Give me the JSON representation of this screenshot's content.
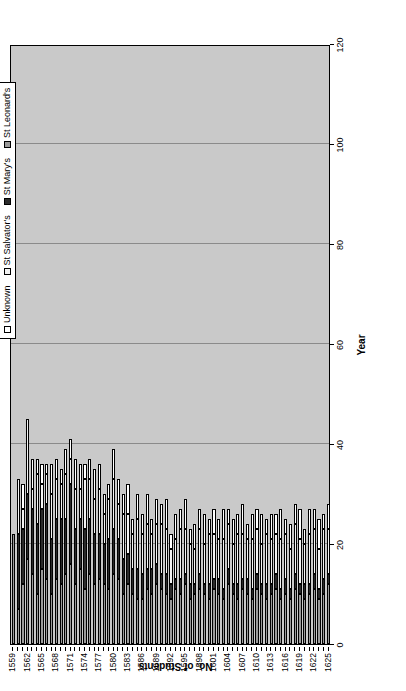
{
  "chart_data": {
    "type": "bar",
    "subtype": "stacked-horizontal-in-rotated-page",
    "title": "",
    "xlabel": "Year",
    "ylabel": "No. of Students",
    "ylim": [
      0,
      120
    ],
    "yticks": [
      0,
      20,
      40,
      60,
      80,
      100,
      120
    ],
    "grid": true,
    "legend_position": "top-right",
    "orientation": "page rotated 90 degrees counter-clockwise",
    "categories": [
      "1559",
      "1560",
      "1561",
      "1562",
      "1563",
      "1564",
      "1565",
      "1566",
      "1567",
      "1568",
      "1569",
      "1570",
      "1571",
      "1572",
      "1573",
      "1574",
      "1575",
      "1576",
      "1577",
      "1578",
      "1579",
      "1580",
      "1581",
      "1582",
      "1583",
      "1584",
      "1585",
      "1586",
      "1587",
      "1588",
      "1589",
      "1590",
      "1591",
      "1592",
      "1593",
      "1594",
      "1595",
      "1596",
      "1597",
      "1598",
      "1599",
      "1600",
      "1601",
      "1602",
      "1603",
      "1604",
      "1605",
      "1606",
      "1607",
      "1608",
      "1609",
      "1610",
      "1611",
      "1612",
      "1613",
      "1614",
      "1615",
      "1616",
      "1617",
      "1618",
      "1619",
      "1620",
      "1621",
      "1622",
      "1623",
      "1624",
      "1625"
    ],
    "tick_labels": [
      "1559",
      "1562",
      "1565",
      "1568",
      "1571",
      "1574",
      "1577",
      "1580",
      "1583",
      "1586",
      "1589",
      "1592",
      "1595",
      "1598",
      "1601",
      "1604",
      "1607",
      "1610",
      "1613",
      "1616",
      "1619",
      "1622",
      "1625"
    ],
    "series": [
      {
        "name": "St Leonard's",
        "color": "#9a9a9a",
        "values": [
          22,
          7,
          12,
          17,
          14,
          10,
          15,
          13,
          10,
          13,
          12,
          14,
          16,
          12,
          15,
          11,
          14,
          12,
          13,
          12,
          11,
          14,
          13,
          10,
          12,
          10,
          9,
          9,
          11,
          10,
          12,
          11,
          10,
          9,
          11,
          10,
          12,
          9,
          10,
          11,
          10,
          9,
          11,
          10,
          9,
          12,
          10,
          9,
          11,
          10,
          9,
          11,
          10,
          9,
          10,
          11,
          9,
          10,
          9,
          11,
          10,
          9,
          10,
          11,
          9,
          10,
          12
        ]
      },
      {
        "name": "St Mary's",
        "color": "#2b2b2b",
        "values": [
          0,
          15,
          11,
          13,
          13,
          14,
          12,
          15,
          11,
          12,
          13,
          11,
          16,
          11,
          10,
          12,
          11,
          10,
          9,
          8,
          10,
          9,
          8,
          7,
          6,
          5,
          6,
          5,
          4,
          5,
          4,
          3,
          4,
          3,
          2,
          3,
          2,
          3,
          2,
          3,
          2,
          3,
          2,
          3,
          2,
          3,
          2,
          3,
          2,
          3,
          2,
          3,
          2,
          3,
          2,
          3,
          2,
          3,
          2,
          3,
          2,
          3,
          2,
          3,
          2,
          3,
          2
        ]
      },
      {
        "name": "St Salvator's",
        "color": "#f2f2f2",
        "values": [
          0,
          11,
          4,
          15,
          4,
          10,
          5,
          6,
          9,
          8,
          7,
          9,
          5,
          8,
          6,
          10,
          8,
          7,
          9,
          6,
          8,
          10,
          7,
          9,
          8,
          7,
          10,
          8,
          9,
          7,
          8,
          10,
          9,
          7,
          8,
          10,
          9,
          8,
          7,
          9,
          8,
          10,
          9,
          8,
          10,
          9,
          8,
          10,
          9,
          8,
          10,
          9,
          8,
          10,
          9,
          8,
          10,
          9,
          8,
          10,
          9,
          8,
          10,
          9,
          8,
          10,
          9
        ]
      },
      {
        "name": "Unknown",
        "color": "#ffffff",
        "values": [
          0,
          0,
          5,
          0,
          6,
          3,
          4,
          2,
          6,
          4,
          3,
          5,
          4,
          6,
          5,
          3,
          4,
          6,
          5,
          4,
          3,
          6,
          5,
          4,
          6,
          3,
          5,
          4,
          6,
          3,
          5,
          4,
          6,
          3,
          5,
          4,
          6,
          3,
          5,
          4,
          6,
          3,
          5,
          4,
          6,
          3,
          5,
          4,
          6,
          3,
          5,
          4,
          6,
          3,
          5,
          4,
          6,
          3,
          5,
          4,
          6,
          3,
          5,
          4,
          6,
          3,
          5
        ]
      }
    ],
    "totals": [
      22,
      33,
      32,
      45,
      37,
      37,
      36,
      36,
      36,
      37,
      35,
      39,
      41,
      37,
      36,
      36,
      37,
      35,
      36,
      30,
      32,
      39,
      33,
      30,
      32,
      25,
      30,
      26,
      30,
      25,
      29,
      28,
      29,
      22,
      26,
      27,
      29,
      23,
      24,
      27,
      26,
      25,
      27,
      25,
      27,
      27,
      25,
      26,
      28,
      24,
      26,
      27,
      26,
      25,
      26,
      26,
      27,
      25,
      24,
      28,
      27,
      23,
      27,
      27,
      25,
      26,
      28
    ],
    "bar_pixel_lengths": [
      22,
      33,
      32,
      45,
      37,
      37,
      36,
      36,
      36,
      37,
      35,
      39,
      41,
      37,
      36,
      36,
      37,
      35,
      36,
      30,
      32,
      39,
      33,
      30,
      32,
      25,
      30,
      26,
      30,
      25,
      29,
      28,
      29,
      22,
      26,
      27,
      29,
      23,
      24,
      27,
      26,
      25,
      27,
      25,
      27,
      27,
      25,
      26,
      28,
      24,
      26,
      27,
      26,
      25,
      26,
      26,
      27,
      25,
      24,
      28,
      27,
      23,
      27,
      27,
      25,
      26,
      28
    ]
  },
  "legend": {
    "items": [
      {
        "label": "Unknown",
        "color": "#ffffff",
        "swatch_class": "seg-unknown"
      },
      {
        "label": "St Salvator's",
        "color": "#f2f2f2",
        "swatch_class": "seg-salvator"
      },
      {
        "label": "St Mary's",
        "color": "#2b2b2b",
        "swatch_class": "seg-mary"
      },
      {
        "label": "St Leonard's",
        "color": "#9a9a9a",
        "swatch_class": "seg-leonard"
      }
    ]
  },
  "axes": {
    "x_title": "Year",
    "y_title": "No. of Students"
  },
  "colors": {
    "plot_background": "#c9c9c9",
    "gridline": "#8a8a8a",
    "axis": "#000000",
    "page_background": "#ffffff"
  }
}
